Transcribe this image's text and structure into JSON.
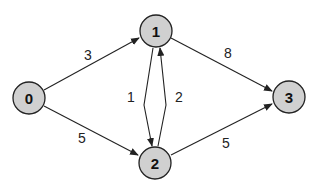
{
  "graph": {
    "type": "directed-weighted",
    "nodes": [
      {
        "id": "0",
        "label": "0",
        "x": 29,
        "y": 98
      },
      {
        "id": "1",
        "label": "1",
        "x": 156,
        "y": 31
      },
      {
        "id": "2",
        "label": "2",
        "x": 155,
        "y": 163
      },
      {
        "id": "3",
        "label": "3",
        "x": 289,
        "y": 97
      }
    ],
    "edges": [
      {
        "from": "0",
        "to": "1",
        "weight": "3"
      },
      {
        "from": "0",
        "to": "2",
        "weight": "5"
      },
      {
        "from": "1",
        "to": "2",
        "weight": "1"
      },
      {
        "from": "2",
        "to": "1",
        "weight": "2"
      },
      {
        "from": "1",
        "to": "3",
        "weight": "8"
      },
      {
        "from": "2",
        "to": "3",
        "weight": "5"
      }
    ]
  },
  "colors": {
    "node_fill": "#d0d0d0",
    "stroke": "#222222",
    "background": "#ffffff"
  }
}
